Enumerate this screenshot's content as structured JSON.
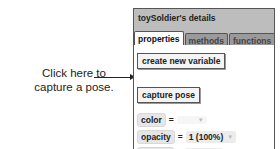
{
  "callout": {
    "line1": "Click here to",
    "line2": "capture a pose."
  },
  "panel": {
    "title": "toySoldier's details",
    "tabs": [
      {
        "label": "properties",
        "active": true
      },
      {
        "label": "methods",
        "active": false
      },
      {
        "label": "functions",
        "active": false
      }
    ],
    "create_variable_label": "create new variable",
    "capture_pose_label": "capture pose",
    "properties": [
      {
        "name": "color",
        "eq": "=",
        "value": ""
      },
      {
        "name": "opacity",
        "eq": "=",
        "value": "1 (100%)"
      },
      {
        "name": "vehicle",
        "eq": "=",
        "value": "world"
      }
    ],
    "dropdown_glyph": "▼"
  }
}
